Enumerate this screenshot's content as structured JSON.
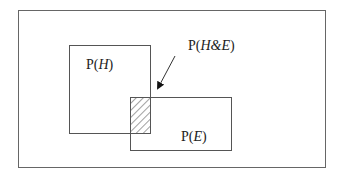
{
  "diagram": {
    "type": "venn-rectangles",
    "universe": {
      "label": ""
    },
    "regions": [
      {
        "id": "H",
        "label_prefix": "P(",
        "label_var": "H",
        "label_suffix": ")"
      },
      {
        "id": "E",
        "label_prefix": "P(",
        "label_var": "E",
        "label_suffix": ")"
      }
    ],
    "intersection": {
      "label_prefix": "P(",
      "label_var": "H&E",
      "label_suffix": ")",
      "fill": "hatched"
    },
    "colors": {
      "stroke": "#555555",
      "text": "#222222",
      "background": "#ffffff"
    }
  }
}
